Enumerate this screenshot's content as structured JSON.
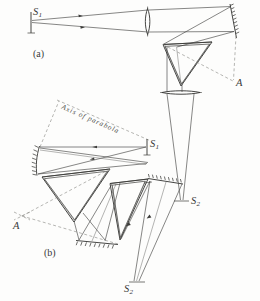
{
  "figure": {
    "ink_color": "#3c3c3a",
    "dash_color": "#7e7e7a",
    "panels": [
      {
        "key": "a",
        "label": "(a)",
        "description": "Lens-collimator spectrograph with prism and camera lens"
      },
      {
        "key": "b",
        "label": "(b)",
        "description": "Off-axis parabolic mirror collimator spectrograph with two prisms"
      }
    ]
  },
  "panel_a": {
    "tag": "(a)",
    "source": {
      "name": "S",
      "sub": "1"
    },
    "focus": {
      "name": "S",
      "sub": "2"
    },
    "vertex": {
      "name": "A"
    },
    "components": [
      {
        "name": "entrance-slit",
        "kind": "slit"
      },
      {
        "name": "collimator-lens",
        "kind": "lens"
      },
      {
        "name": "plane-mirror",
        "kind": "mirror"
      },
      {
        "name": "dispersing-prism",
        "kind": "prism"
      },
      {
        "name": "camera-lens",
        "kind": "lens"
      }
    ]
  },
  "panel_b": {
    "tag": "(b)",
    "source": {
      "name": "S",
      "sub": "1"
    },
    "focus": {
      "name": "S",
      "sub": "2"
    },
    "vertex": {
      "name": "A"
    },
    "axis_label": "Axis of parabola",
    "components": [
      {
        "name": "parabolic-mirror",
        "kind": "mirror"
      },
      {
        "name": "entrance-slit",
        "kind": "slit"
      },
      {
        "name": "first-prism",
        "kind": "prism"
      },
      {
        "name": "second-prism",
        "kind": "prism"
      },
      {
        "name": "folding-mirror",
        "kind": "mirror"
      },
      {
        "name": "camera-mirror",
        "kind": "mirror"
      }
    ]
  }
}
